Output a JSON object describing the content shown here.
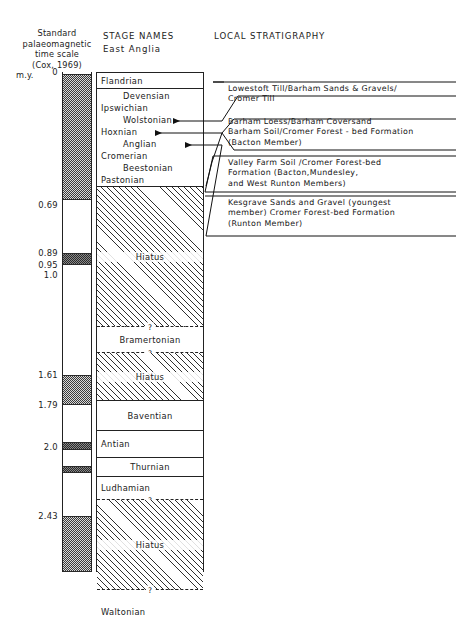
{
  "headers": {
    "left_col": [
      "Standard",
      "palaeomagnetic",
      "time scale",
      "(Cox, 1969)"
    ],
    "left_unit": "m.y.",
    "stage_title": "STAGE NAMES",
    "stage_subtitle": "East Anglia",
    "strat_title": "LOCAL STRATIGRAPHY"
  },
  "chart_data": {
    "type": "table",
    "xlabel": "",
    "ylabel": "m.y.",
    "axis_range": [
      0,
      2.6
    ],
    "grid": false,
    "legend": "none",
    "columns": [
      "Standard palaeomagnetic time scale (Cox, 1969) m.y.",
      "STAGE NAMES East Anglia",
      "LOCAL STRATIGRAPHY"
    ],
    "axis_ticks": [
      {
        "label": "0",
        "value": 0,
        "y": 72
      },
      {
        "label": "0.69",
        "value": 0.69,
        "y": 205
      },
      {
        "label": "0.89",
        "value": 0.89,
        "y": 253
      },
      {
        "label": "0.95",
        "value": 0.95,
        "y": 265
      },
      {
        "label": "1.0",
        "value": 1.0,
        "y": 275
      },
      {
        "label": "1.61",
        "value": 1.61,
        "y": 375
      },
      {
        "label": "1.79",
        "value": 1.79,
        "y": 405
      },
      {
        "label": "2.0",
        "value": 2.0,
        "y": 447
      },
      {
        "label": "2.43",
        "value": 2.43,
        "y": 516
      }
    ],
    "polarity_bands": [
      {
        "polarity": "normal",
        "top": 74,
        "height": 126
      },
      {
        "polarity": "reversed",
        "top": 200,
        "height": 53
      },
      {
        "polarity": "normal",
        "top": 253,
        "height": 12
      },
      {
        "polarity": "reversed",
        "top": 265,
        "height": 110
      },
      {
        "polarity": "normal",
        "top": 375,
        "height": 30
      },
      {
        "polarity": "reversed",
        "top": 405,
        "height": 37
      },
      {
        "polarity": "normal",
        "top": 442,
        "height": 8
      },
      {
        "polarity": "reversed",
        "top": 450,
        "height": 16
      },
      {
        "polarity": "normal",
        "top": 466,
        "height": 7
      },
      {
        "polarity": "reversed",
        "top": 473,
        "height": 43
      },
      {
        "polarity": "normal",
        "top": 516,
        "height": 56
      }
    ],
    "stages": [
      {
        "name": "Flandrian",
        "align": "left",
        "top": 0,
        "height": 17,
        "fill": "plain",
        "top_border": "solid",
        "bottom_border": "solid"
      },
      {
        "name": "Devensian",
        "align": "indent",
        "top": 17,
        "height": 13,
        "fill": "plain",
        "top_border": "none",
        "bottom_border": "none"
      },
      {
        "name": "Ipswichian",
        "align": "left",
        "top": 30,
        "height": 12,
        "fill": "plain",
        "top_border": "none",
        "bottom_border": "none"
      },
      {
        "name": "Wolstonian",
        "align": "indent",
        "top": 42,
        "height": 12,
        "fill": "plain",
        "top_border": "none",
        "bottom_border": "none"
      },
      {
        "name": "Hoxnian",
        "align": "left",
        "top": 54,
        "height": 12,
        "fill": "plain",
        "top_border": "none",
        "bottom_border": "none"
      },
      {
        "name": "Anglian",
        "align": "indent",
        "top": 66,
        "height": 12,
        "fill": "plain",
        "top_border": "none",
        "bottom_border": "none"
      },
      {
        "name": "Cromerian",
        "align": "left",
        "top": 78,
        "height": 12,
        "fill": "plain",
        "top_border": "none",
        "bottom_border": "none"
      },
      {
        "name": "Beestonian",
        "align": "indent",
        "top": 90,
        "height": 12,
        "fill": "plain",
        "top_border": "none",
        "bottom_border": "none"
      },
      {
        "name": "Pastonian",
        "align": "left",
        "top": 102,
        "height": 13,
        "fill": "plain",
        "top_border": "none",
        "bottom_border": "solid"
      },
      {
        "name": "Hiatus",
        "align": "center",
        "top": 115,
        "height": 140,
        "fill": "hatch",
        "top_border": "none",
        "bottom_border": "dashed"
      },
      {
        "name": "Bramertonian",
        "align": "center",
        "top": 255,
        "height": 26,
        "fill": "plain",
        "top_border": "none",
        "bottom_border": "dashed"
      },
      {
        "name": "Hiatus",
        "align": "center",
        "top": 281,
        "height": 48,
        "fill": "hatch",
        "top_border": "none",
        "bottom_border": "solid"
      },
      {
        "name": "Baventian",
        "align": "center",
        "top": 329,
        "height": 30,
        "fill": "plain",
        "top_border": "none",
        "bottom_border": "solid"
      },
      {
        "name": "Antian",
        "align": "left",
        "top": 359,
        "height": 27,
        "fill": "plain",
        "top_border": "none",
        "bottom_border": "solid"
      },
      {
        "name": "Thurnian",
        "align": "center",
        "top": 386,
        "height": 19,
        "fill": "plain",
        "top_border": "none",
        "bottom_border": "solid"
      },
      {
        "name": "Ludhamian",
        "align": "left",
        "top": 405,
        "height": 23,
        "fill": "plain",
        "top_border": "none",
        "bottom_border": "dashed"
      },
      {
        "name": "Hiatus",
        "align": "center",
        "top": 428,
        "height": 90,
        "fill": "hatch",
        "top_border": "none",
        "bottom_border": "dashed"
      },
      {
        "name": "Waltonian",
        "align": "left",
        "top": 518,
        "height": 44,
        "fill": "plain",
        "top_border": "none",
        "bottom_border": "none"
      }
    ],
    "stage_uncertainty_marks": [
      "?",
      "?",
      "?"
    ],
    "stratigraphy": [
      {
        "text": "Lowestoft Till/Barham Sands & Gravels/\nCromer Till",
        "points_to": "Anglian",
        "top": 84
      },
      {
        "text": "Barham Loess/Barham Coversand\nBarham Soil/Cromer Forest - bed Formation\n(Bacton Member)",
        "points_to": "Cromerian",
        "top": 117
      },
      {
        "text": "Valley Farm Soil /Cromer Forest-bed\nFormation  (Bacton,Mundesley,\nand West Runton Members)",
        "points_to": "Cromerian",
        "top": 158
      },
      {
        "text": "Kesgrave Sands and Gravel (youngest\nmember) Cromer Forest-bed Formation\n(Runton Member)",
        "points_to": "Beestonian",
        "top": 198
      }
    ]
  }
}
